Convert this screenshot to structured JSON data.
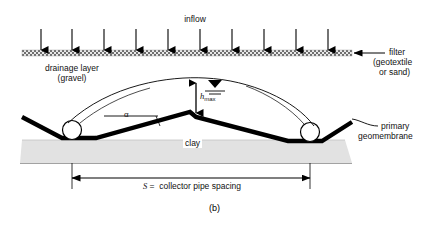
{
  "figure": {
    "caption": "(b)",
    "background": "#ffffff",
    "clay_fill": "#e2e2e2",
    "line_color": "#000000"
  },
  "labels": {
    "inflow": "inflow",
    "filter_line1": "filter",
    "filter_line2": "(geotextile",
    "filter_line3": "or sand)",
    "drainage_line1": "drainage layer",
    "drainage_line2": "(gravel)",
    "h_max_symbol": "h",
    "h_max_subscript": "max",
    "alpha": "α",
    "clay": "clay",
    "geomembrane_line1": "primary",
    "geomembrane_line2": "geomembrane",
    "spacing_symbol": "S",
    "spacing_text": " =  collector pipe spacing"
  },
  "geometry": {
    "inflow_arrow_count": 10,
    "collector_pipe_count": 2,
    "water_table_symbol": "phreatic-surface-triangle"
  }
}
